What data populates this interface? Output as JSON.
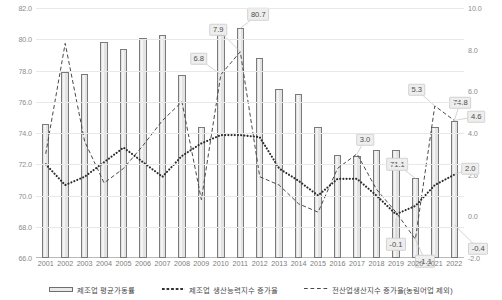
{
  "chart_data": {
    "type": "bar",
    "title": "",
    "subtitle": "",
    "xlabel": "",
    "ylabel": "",
    "grid": true,
    "legend_position": "bottom",
    "categories": [
      "2001",
      "2002",
      "2003",
      "2004",
      "2005",
      "2006",
      "2007",
      "2008",
      "2009",
      "2010",
      "2011",
      "2012",
      "2013",
      "2014",
      "2015",
      "2016",
      "2017",
      "2018",
      "2019",
      "2020",
      "2021",
      "2022"
    ],
    "axes": {
      "left": {
        "label": "",
        "ylim": [
          66.0,
          82.0
        ],
        "ticks": [
          "66.0",
          "68.0",
          "70.0",
          "72.0",
          "74.0",
          "76.0",
          "78.0",
          "80.0",
          "82.0"
        ],
        "tick_values": [
          66.0,
          68.0,
          70.0,
          72.0,
          74.0,
          76.0,
          78.0,
          80.0,
          82.0
        ]
      },
      "right": {
        "label": "",
        "ylim": [
          -2.0,
          10.0
        ],
        "ticks": [
          "-2.0",
          "0.0",
          "2.0",
          "4.0",
          "6.0",
          "8.0",
          "10.0"
        ],
        "tick_values": [
          -2.0,
          0.0,
          2.0,
          4.0,
          6.0,
          8.0,
          10.0
        ]
      }
    },
    "series": [
      {
        "name": "제조업 평균가동률",
        "type": "bar",
        "axis": "left",
        "values": [
          74.6,
          77.9,
          77.8,
          79.8,
          79.4,
          80.1,
          80.3,
          77.7,
          74.4,
          80.3,
          80.7,
          78.8,
          76.8,
          76.5,
          74.4,
          72.6,
          72.5,
          72.9,
          72.9,
          71.1,
          74.4,
          74.8
        ]
      },
      {
        "name": "제조업 생산능력지수 증가율",
        "type": "line",
        "style": "dotted",
        "axis": "right",
        "values": [
          2.5,
          1.5,
          1.9,
          2.6,
          3.3,
          2.6,
          1.9,
          2.9,
          3.5,
          3.9,
          3.9,
          3.8,
          2.3,
          1.7,
          1.0,
          1.8,
          1.8,
          1.0,
          0.1,
          0.5,
          1.5,
          2.0
        ]
      },
      {
        "name": "전산업생산지수 증가율(농림어업 제외)",
        "type": "line",
        "style": "dashed",
        "axis": "right",
        "values": [
          3.0,
          8.3,
          3.6,
          1.6,
          2.3,
          3.4,
          4.6,
          5.5,
          0.8,
          6.8,
          7.9,
          1.9,
          1.5,
          0.6,
          0.2,
          2.3,
          3.0,
          1.3,
          0.2,
          -1.1,
          5.3,
          4.6
        ]
      }
    ],
    "annotations": [
      {
        "label": "7.9",
        "series": "전산업생산지수 증가율(농림어업 제외)",
        "category": "2011",
        "value": 7.9
      },
      {
        "label": "6.8",
        "series": "전산업생산지수 증가율(농림어업 제외)",
        "category": "2010",
        "value": 6.8
      },
      {
        "label": "80.7",
        "series": "제조업 평균가동률",
        "category": "2011",
        "value": 80.7
      },
      {
        "label": "3.0",
        "series": "전산업생산지수 증가율(농림어업 제외)",
        "category": "2017",
        "value": 3.0
      },
      {
        "label": "-0.1",
        "series": "제조업 생산능력지수 증가율",
        "category": "2019",
        "value": -0.1
      },
      {
        "label": "5.3",
        "series": "전산업생산지수 증가율(농림어업 제외)",
        "category": "2021",
        "value": 5.3
      },
      {
        "label": "71.1",
        "series": "제조업 평균가동률",
        "category": "2020",
        "value": 71.1
      },
      {
        "label": "-1.1",
        "series": "전산업생산지수 증가율(농림어업 제외)",
        "category": "2020",
        "value": -1.1
      },
      {
        "label": "74.8",
        "series": "제조업 평균가동률",
        "category": "2022",
        "value": 74.8
      },
      {
        "label": "4.6",
        "series": "전산업생산지수 증가율(농림어업 제외)",
        "category": "2022",
        "value": 4.6
      },
      {
        "label": "2.0",
        "series": "제조업 생산능력지수 증가율",
        "category": "2022",
        "value": 2.0
      },
      {
        "label": "-0.4",
        "series": "제조업 생산능력지수 증가율",
        "category": "2022",
        "value": -0.4
      }
    ]
  },
  "legend": {
    "items": [
      {
        "label": "제조업 평균가동률",
        "marker": "bar-swatch"
      },
      {
        "label": "제조업 생산능력지수 증가율",
        "marker": "dotted-line-swatch"
      },
      {
        "label": "전산업생산지수 증가율(농림어업 제외)",
        "marker": "dashed-line-swatch"
      }
    ]
  },
  "colors": {
    "bar_fill": "#e3e3e3",
    "bar_stroke": "#7a7a7a",
    "dotted_line": "#2b2b2b",
    "dashed_line": "#4a4a4a",
    "gridline": "#e8e8e8",
    "tick_text": "#8c8c8c",
    "callout_bg": "#eeeeee"
  }
}
